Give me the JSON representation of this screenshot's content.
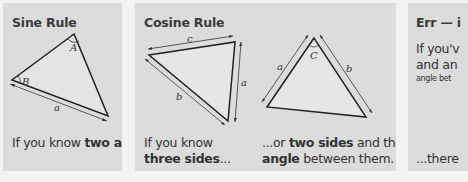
{
  "panels": [
    {
      "title": "Sine Rule",
      "diagram": {
        "angle_labels": [
          "A",
          "B"
        ],
        "side_labels": [
          "a"
        ]
      },
      "caption": {
        "parts": [
          "If you know ",
          "two angles",
          " and a ",
          "side",
          "."
        ]
      }
    },
    {
      "title": "Cosine Rule",
      "diagrams": [
        {
          "side_labels": [
            "c",
            "b",
            "a"
          ]
        },
        {
          "angle_labels": [
            "C"
          ],
          "side_labels": [
            "a",
            "b"
          ]
        }
      ],
      "captions": [
        {
          "parts": [
            "If you know",
            "three sides",
            "..."
          ]
        },
        {
          "parts": [
            "...or ",
            "two sides",
            " and the",
            "angle",
            " between them."
          ]
        }
      ]
    },
    {
      "title": "Err — i",
      "lines": [
        "If you'v",
        "and an",
        "angle bet"
      ],
      "footer": "...there"
    }
  ],
  "colors": {
    "page_background": "#f3f3f3",
    "panel_background": "#dcdcdc",
    "ink": "#2b2b2b"
  }
}
